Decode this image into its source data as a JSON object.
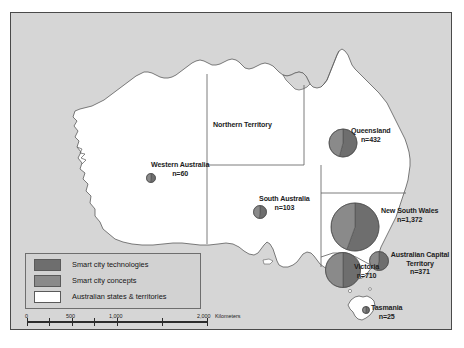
{
  "figure": {
    "title_visible": false,
    "background_color": "#d6d6d6",
    "land_color": "#ffffff",
    "border_color": "#4a4a4a"
  },
  "chart_data": {
    "type": "pie",
    "xlabel": "",
    "ylabel": "",
    "legend_position": "bottom-left",
    "grid": false,
    "symbol_note": "Proportional circles (pie symbols) sized by total n, split into two slices",
    "categories": [
      "Smart city technologies",
      "Smart city concepts"
    ],
    "series": [
      {
        "name": "Smart city technologies",
        "color": "#6e6e6e"
      },
      {
        "name": "Smart city concepts",
        "color": "#8a8a8a"
      }
    ],
    "regions": [
      {
        "name": "New South Wales",
        "label": "New South Wales",
        "count_label": "n=1,372",
        "value": 1372,
        "cx": 344.0,
        "cy": 214.0,
        "r": 24.0,
        "slice_split_deg": 200,
        "label_x": 378,
        "label_y": 198,
        "label_align": "left"
      },
      {
        "name": "Victoria",
        "label": "Victoria",
        "count_label": "n=710",
        "value": 710,
        "cx": 332.0,
        "cy": 257.0,
        "r": 17.5,
        "slice_split_deg": 180,
        "label_x": 347,
        "label_y": 255,
        "label_align": "left"
      },
      {
        "name": "Queensland",
        "label": "Queensland",
        "count_label": "n=432",
        "value": 432,
        "cx": 332.0,
        "cy": 130.0,
        "r": 14.0,
        "slice_split_deg": 195,
        "label_x": 349,
        "label_y": 119,
        "label_align": "left"
      },
      {
        "name": "Australian Capital Territory",
        "label": "Australian Capital Territory",
        "count_label": "n=371",
        "value": 371,
        "cx": 368.0,
        "cy": 248.0,
        "r": 9.5,
        "slice_split_deg": 190,
        "label_x": 380,
        "label_y": 243,
        "label_align": "left"
      },
      {
        "name": "South Australia",
        "label": "South Australia",
        "count_label": "n=103",
        "value": 103,
        "cx": 249.0,
        "cy": 199.0,
        "r": 6.5,
        "slice_split_deg": 185,
        "label_x": 262,
        "label_y": 186,
        "label_align": "left"
      },
      {
        "name": "Western Australia",
        "label": "Western Australia",
        "count_label": "n=60",
        "value": 60,
        "cx": 140.0,
        "cy": 165.0,
        "r": 4.5,
        "slice_split_deg": 185,
        "label_x": 152,
        "label_y": 152,
        "label_align": "left"
      },
      {
        "name": "Tasmania",
        "label": "Tasmania",
        "count_label": "n=25",
        "value": 25,
        "cx": 355.0,
        "cy": 297.0,
        "r": 3.5,
        "slice_split_deg": 185,
        "label_x": 364,
        "label_y": 296,
        "label_align": "left"
      },
      {
        "name": "Northern Territory",
        "label": "Northern Territory",
        "count_label": "",
        "value": null,
        "cx": null,
        "cy": null,
        "r": 0,
        "slice_split_deg": 0,
        "label_x": 202,
        "label_y": 112,
        "label_align": "left"
      }
    ]
  },
  "legend": {
    "items": [
      {
        "label": "Smart city technologies",
        "color": "#6e6e6e",
        "swatch": "legend-swatch-technologies"
      },
      {
        "label": "Smart city concepts",
        "color": "#8a8a8a",
        "swatch": "legend-swatch-concepts"
      },
      {
        "label": "Australian states & territories",
        "color": "#ffffff",
        "swatch": "legend-swatch-states"
      }
    ]
  },
  "scale_bar": {
    "unit_label": "Kilometers",
    "ticks": [
      "0",
      "500",
      "1,000",
      "2,000"
    ],
    "tick_positions_px": [
      2,
      47,
      92,
      182
    ],
    "minor_tick_positions_px": [
      24.5,
      69.5,
      137
    ]
  },
  "map_labels": {
    "northern_territory": "Northern Territory",
    "western_australia": "Western Australia",
    "south_australia": "South Australia",
    "queensland": "Queensland",
    "new_south_wales": "New South Wales",
    "victoria": "Victoria",
    "australian_capital_territory": "Australian Capital Territory",
    "tasmania": "Tasmania"
  }
}
